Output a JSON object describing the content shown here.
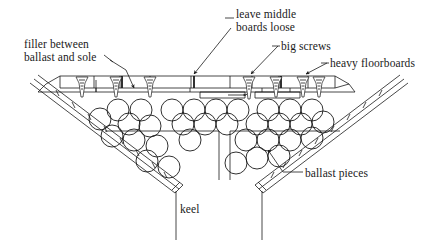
{
  "diagram": {
    "type": "technical-cross-section",
    "background_color": "#ffffff",
    "line_color": "#1a1a1a",
    "fill_color": "#ffffff"
  },
  "labels": {
    "filler": "filler between\nballast and sole",
    "filler_line1": "filler between",
    "filler_line2": "ballast and sole",
    "leave_middle": "leave middle\nboards loose",
    "leave_middle_line1": "leave middle",
    "leave_middle_line2": "boards loose",
    "big_screws": "big screws",
    "heavy_floorboards": "heavy floorboards",
    "ballast_pieces": "ballast pieces",
    "keel": "keel"
  },
  "parts": {
    "keel_label": "keel",
    "ballast_label": "ballast pieces",
    "floorboards_label": "heavy floorboards",
    "screws_label": "big screws",
    "loose_boards_label": "leave middle boards loose",
    "filler_label": "filler between ballast and sole"
  },
  "counts": {
    "screws": 7,
    "ballast_pieces": 33,
    "hull_planks_per_side": 3,
    "keel_lines": 2
  }
}
